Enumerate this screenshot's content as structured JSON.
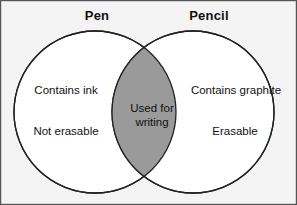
{
  "figure": {
    "kind": "venn-diagram",
    "background_color": "#f4f4f4",
    "border_color": "#555555",
    "outline_color": "#222222",
    "intersection_fill": "#9a9a9a",
    "circle_fill": "#ffffff",
    "text_color": "#111111"
  },
  "headers": {
    "left": "Pen",
    "right": "Pencil"
  },
  "sets": {
    "left": {
      "title": "Pen",
      "items": [
        "Contains ink",
        "Not erasable"
      ]
    },
    "right": {
      "title": "Pencil",
      "items": [
        "Contains graphite",
        "Erasable"
      ]
    },
    "intersection": {
      "lines": [
        "Used for",
        "writing"
      ]
    }
  }
}
